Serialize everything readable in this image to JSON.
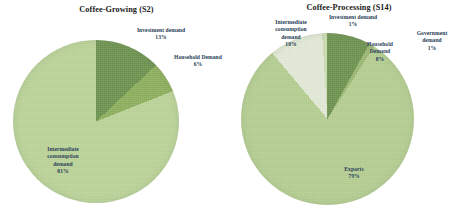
{
  "figure": {
    "background": "#ffffff",
    "label_color": "#243b53"
  },
  "charts": [
    {
      "id": "coffee-growing",
      "title": "Coffee-Growing (S2)",
      "labels": {
        "investment": "Investment demand\n13%",
        "household": "Household Demand\n6%",
        "intermediate": "Intermediate\nconsumption\ndemand\n81%"
      }
    },
    {
      "id": "coffee-processing",
      "title": "Coffee-Processing (S14)",
      "labels": {
        "intermediate": "Intermediate\nconsumption\ndemand\n10%",
        "investment": "Investment demand\n1%",
        "household": "Household\nDemand\n8%",
        "government": "Government\ndemand\n1%",
        "exports": "Exports\n79%"
      }
    }
  ],
  "chart_data": [
    {
      "type": "pie",
      "title": "Coffee-Growing (S2)",
      "categories": [
        "Investment demand",
        "Household Demand",
        "Intermediate consumption demand"
      ],
      "values": [
        13,
        6,
        81
      ],
      "unit": "%",
      "colors": [
        "#6f9451",
        "#8fb05f",
        "#bcd49a"
      ],
      "start_angle_deg": 0,
      "direction": "clockwise",
      "legend": "none",
      "labels_position": "outside-and-inside"
    },
    {
      "type": "pie",
      "title": "Coffee-Processing (S14)",
      "categories": [
        "Household Demand",
        "Government demand",
        "Exports",
        "Intermediate consumption demand",
        "Investment demand"
      ],
      "values": [
        8,
        1,
        79,
        10,
        1
      ],
      "unit": "%",
      "colors": [
        "#6f9451",
        "#9bb873",
        "#b6cf93",
        "#e3ead7",
        "#cddcb4"
      ],
      "start_angle_deg": 0,
      "direction": "clockwise",
      "legend": "none",
      "labels_position": "outside-and-inside"
    }
  ]
}
